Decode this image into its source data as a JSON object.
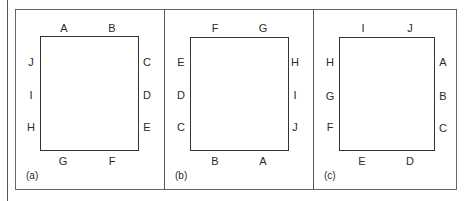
{
  "figure": {
    "panels": [
      {
        "caption": "(a)",
        "top": [
          "A",
          "B"
        ],
        "right": [
          "C",
          "D",
          "E"
        ],
        "bottom": [
          "G",
          "F"
        ],
        "left": [
          "J",
          "I",
          "H"
        ]
      },
      {
        "caption": "(b)",
        "top": [
          "F",
          "G"
        ],
        "right": [
          "H",
          "I",
          "J"
        ],
        "bottom": [
          "B",
          "A"
        ],
        "left": [
          "E",
          "D",
          "C"
        ]
      },
      {
        "caption": "(c)",
        "top": [
          "I",
          "J"
        ],
        "right": [
          "A",
          "B",
          "C"
        ],
        "bottom": [
          "E",
          "D"
        ],
        "left": [
          "H",
          "G",
          "F"
        ]
      }
    ]
  }
}
